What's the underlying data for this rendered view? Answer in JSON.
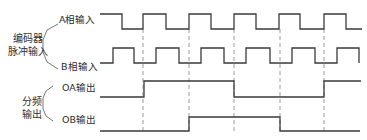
{
  "groups": [
    {
      "id": "encoder",
      "label_line1": "编码器",
      "label_line2": "脉冲输入"
    },
    {
      "id": "divider",
      "label_line1": "分频",
      "label_line2": "输出"
    }
  ],
  "signals": [
    {
      "id": "a",
      "label": "A相输入",
      "y_high": 14,
      "y_low": 29,
      "start_level": "high",
      "x_start": 100,
      "x_end": 362,
      "edges": [
        122,
        143,
        166,
        189,
        211,
        234,
        256,
        279,
        300,
        324,
        346
      ]
    },
    {
      "id": "b",
      "label": "B相输入",
      "y_high": 48,
      "y_low": 63,
      "start_level": "low",
      "x_start": 100,
      "x_end": 359,
      "edges": [
        113,
        134,
        156,
        179,
        201,
        224,
        246,
        270,
        292,
        315,
        337,
        359
      ]
    },
    {
      "id": "oa",
      "label": "OA输出",
      "y_high": 81,
      "y_low": 97,
      "start_level": "low",
      "x_start": 100,
      "x_end": 361,
      "edges": [
        144,
        234,
        324
      ]
    },
    {
      "id": "ob",
      "label": "OB输出",
      "y_high": 117,
      "y_low": 131,
      "start_level": "low",
      "x_start": 100,
      "x_end": 360,
      "edges": [
        189,
        280
      ]
    }
  ],
  "dashed_guides": {
    "x": [
      143,
      189,
      234,
      280,
      324
    ],
    "y_top": 29,
    "y_bottom": 132
  },
  "colors": {
    "line": "#3a3a3a",
    "dashed": "#9a9a9a",
    "text": "#2e2e2e"
  }
}
